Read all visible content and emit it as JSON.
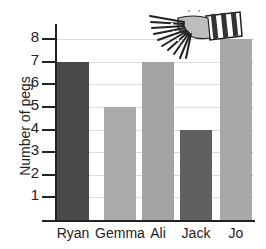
{
  "chart_data": {
    "type": "bar",
    "title": "",
    "xlabel": "",
    "ylabel": "Number of pegs",
    "categories": [
      "Ryan",
      "Gemma",
      "Ali",
      "Jack",
      "Jo"
    ],
    "values": [
      7,
      5,
      7,
      4,
      8
    ],
    "bar_colors": [
      "#4a4a4a",
      "#ababab",
      "#a3a3a3",
      "#5f5f5f",
      "#a8a8a8"
    ],
    "yticks": [
      1,
      2,
      3,
      4,
      5,
      6,
      7,
      8
    ],
    "ylim": [
      0,
      8
    ],
    "grid": true,
    "legend": null,
    "annotations": [
      "illustration of a hand holding clothes pegs"
    ]
  },
  "labels": {
    "ylabel": "Number of pegs",
    "categories": [
      "Ryan",
      "Gemma",
      "Ali",
      "Jack",
      "Jo"
    ],
    "yticks": [
      "1",
      "2",
      "3",
      "4",
      "5",
      "6",
      "7",
      "8"
    ]
  }
}
